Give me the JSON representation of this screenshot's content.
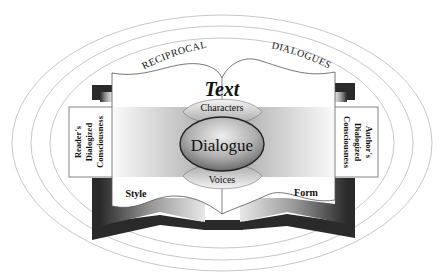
{
  "diagram": {
    "arc_text": {
      "left": "RECIPROCAL",
      "right": "DIALOGUES"
    },
    "title": "Text",
    "center": {
      "label": "Dialogue",
      "top": "Characters",
      "bottom": "Voices"
    },
    "left_panel": {
      "line1": "Reader's",
      "line2": "Dialogized",
      "line3": "Consciousness"
    },
    "right_panel": {
      "line1": "Author's",
      "line2": "Dialogized",
      "line3": "Consciousness"
    },
    "page_labels": {
      "left": "Style",
      "right": "Form"
    },
    "colors": {
      "ring": "#c8c8c8",
      "book_dark": "#2a2a2a",
      "page": "#ffffff",
      "text": "#111111"
    }
  }
}
